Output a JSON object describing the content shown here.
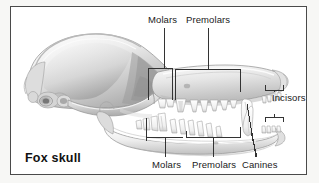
{
  "figure": {
    "caption": "Fox skull",
    "frame_border_color": "#4a4a4a",
    "background_color": "#ffffff",
    "outer_background_color": "#f7f7f5",
    "text_color": "#1a1a1a",
    "leader_line_color": "#333333"
  },
  "labels": {
    "molars_top": "Molars",
    "premolars_top": "Premolars",
    "incisors": "Incisors",
    "molars_bottom": "Molars",
    "premolars_bottom": "Premolars",
    "canines": "Canines"
  },
  "annotations": [
    {
      "name": "upper-molars",
      "label": "Molars",
      "jaw": "upper",
      "marker": "bracket-box"
    },
    {
      "name": "upper-premolars",
      "label": "Premolars",
      "jaw": "upper",
      "marker": "bracket-box"
    },
    {
      "name": "incisors",
      "label": "Incisors",
      "jaw": "both",
      "marker": "double-bracket"
    },
    {
      "name": "lower-molars",
      "label": "Molars",
      "jaw": "lower",
      "marker": "bracket-box"
    },
    {
      "name": "lower-premolars",
      "label": "Premolars",
      "jaw": "lower",
      "marker": "bracket-box"
    },
    {
      "name": "canines",
      "label": "Canines",
      "jaw": "both",
      "marker": "leader-lines"
    }
  ]
}
